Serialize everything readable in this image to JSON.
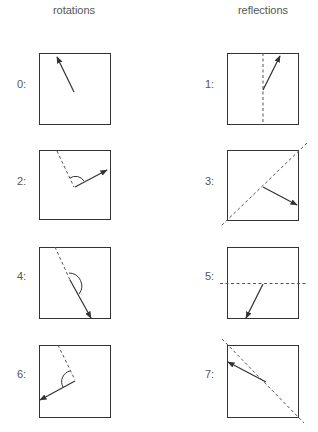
{
  "titles": {
    "left": "rotations",
    "right": "reflections"
  },
  "labels": [
    "0:",
    "1:",
    "2:",
    "3:",
    "4:",
    "5:",
    "6:",
    "7:"
  ],
  "colors": {
    "line": "#333333",
    "text": "#555555",
    "dashed": "#555555"
  },
  "panels": [
    {
      "id": 0,
      "type": "rotation",
      "box": [
        39,
        53,
        71,
        71
      ],
      "arrow": [
        [
          73,
          92
        ],
        [
          56,
          58
        ]
      ]
    },
    {
      "id": 1,
      "type": "reflection",
      "box": [
        227,
        53,
        71,
        71
      ],
      "axis": [
        [
          263,
          53
        ],
        [
          263,
          124
        ]
      ],
      "arrow": [
        [
          263,
          91
        ],
        [
          280,
          56
        ]
      ]
    },
    {
      "id": 2,
      "type": "rotation",
      "box": [
        39,
        150,
        71,
        69
      ],
      "dashed": [
        [
          57,
          151
        ],
        [
          73,
          187
        ]
      ],
      "arc": true,
      "arrow": [
        [
          75,
          187
        ],
        [
          107,
          170
        ]
      ]
    },
    {
      "id": 3,
      "type": "reflection",
      "box": [
        227,
        150,
        71,
        70
      ],
      "axis": [
        [
          307,
          143
        ],
        [
          221,
          226
        ]
      ],
      "arrow": [
        [
          263,
          187
        ],
        [
          296,
          205
        ]
      ]
    },
    {
      "id": 4,
      "type": "rotation",
      "box": [
        39,
        247,
        71,
        71
      ],
      "dashed": [
        [
          55,
          247
        ],
        [
          71,
          282
        ]
      ],
      "arc": true,
      "arrow": [
        [
          71,
          282
        ],
        [
          91,
          319
        ]
      ]
    },
    {
      "id": 5,
      "type": "reflection",
      "box": [
        227,
        247,
        71,
        71
      ],
      "axis": [
        [
          220,
          283
        ],
        [
          307,
          283
        ]
      ],
      "arrow": [
        [
          262,
          283
        ],
        [
          247,
          317
        ]
      ]
    },
    {
      "id": 6,
      "type": "rotation",
      "box": [
        39,
        345,
        71,
        72
      ],
      "dashed": [
        [
          57,
          345
        ],
        [
          75,
          380
        ]
      ],
      "arc": true,
      "arrow": [
        [
          75,
          380
        ],
        [
          41,
          399
        ]
      ]
    },
    {
      "id": 7,
      "type": "reflection",
      "box": [
        227,
        345,
        71,
        72
      ],
      "axis": [
        [
          222,
          339
        ],
        [
          303,
          423
        ]
      ],
      "arrow": [
        [
          264,
          382
        ],
        [
          229,
          362
        ]
      ]
    }
  ]
}
